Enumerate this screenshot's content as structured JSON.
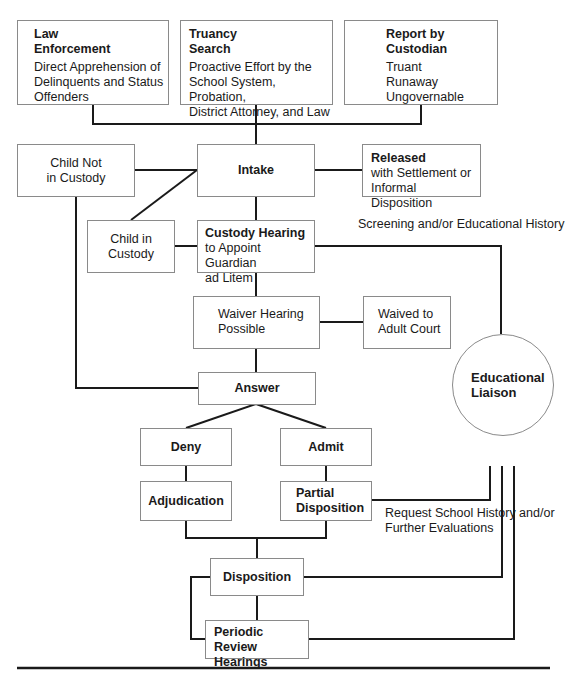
{
  "diagram": {
    "type": "flowchart",
    "sources": [
      {
        "title_line1": "Law",
        "title_line2": "Enforcement",
        "desc": [
          "Direct Apprehension of",
          "Delinquents and Status",
          "Offenders"
        ]
      },
      {
        "title_line1": "Truancy",
        "title_line2": "Search",
        "desc": [
          "Proactive Effort by the",
          "School System, Probation,",
          "District Attorney, and Law"
        ]
      },
      {
        "title_line1": "Report by",
        "title_line2": "Custodian",
        "desc": [
          "Truant",
          "Runaway",
          "Ungovernable"
        ]
      }
    ],
    "child_not_in_custody": [
      "Child Not",
      "in Custody"
    ],
    "intake": "Intake",
    "released": {
      "title": "Released",
      "desc": [
        "with Settlement or",
        "Informal Disposition"
      ]
    },
    "child_in_custody": [
      "Child in",
      "Custody"
    ],
    "custody_hearing": {
      "title": "Custody Hearing",
      "desc": [
        "to Appoint Guardian",
        "ad Litem"
      ]
    },
    "screening_label": [
      "Screening and/or",
      "Educational History"
    ],
    "waiver_hearing": [
      "Waiver Hearing",
      "Possible"
    ],
    "waived": [
      "Waived to",
      "Adult Court"
    ],
    "answer": "Answer",
    "educational_liaison": [
      "Educational",
      "Liaison"
    ],
    "deny": "Deny",
    "admit": "Admit",
    "adjudication": "Adjudication",
    "partial_disposition": [
      "Partial",
      "Disposition"
    ],
    "request_label": [
      "Request School",
      "History and/or",
      "Further Evaluations"
    ],
    "disposition": "Disposition",
    "periodic_review": [
      "Periodic Review",
      "Hearings"
    ],
    "colors": {
      "line": "#1a1a1a",
      "box_border": "#8a8a8a",
      "background": "#ffffff"
    }
  }
}
